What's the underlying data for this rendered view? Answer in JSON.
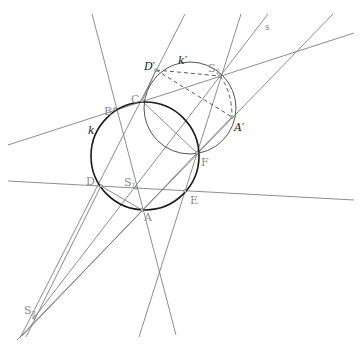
{
  "title_fragment": "",
  "colors": {
    "background": "#ffffff",
    "thin_line": "#707070",
    "circle_k": "#1a1a1a",
    "circle_k_prime": "#555555",
    "dashed": "#444444",
    "label_gray": "#8a8a8a",
    "label_dark": "#222222"
  },
  "labels": {
    "B": "B",
    "C": "C",
    "D": "D",
    "E": "E",
    "F": "F",
    "A": "A",
    "S1": "S",
    "S1_sub": "1",
    "S2": "S",
    "S2_sub": "2",
    "S3": "S",
    "S3_sub": "3",
    "D_prime": "D′",
    "A_prime": "A′",
    "k": "k",
    "k_prime": "k′",
    "s": "s"
  },
  "points": {
    "A": [
      142,
      210
    ],
    "B": [
      115,
      109
    ],
    "C": [
      142,
      101
    ],
    "D": [
      101,
      186
    ],
    "E": [
      185,
      191
    ],
    "F": [
      197,
      153
    ],
    "S1": [
      136,
      188
    ],
    "S2": [
      220,
      76
    ],
    "S3": [
      34,
      318
    ],
    "D_prime": [
      156,
      70
    ],
    "A_prime": [
      232,
      117
    ]
  },
  "circles": {
    "k": {
      "cx": 145,
      "cy": 156,
      "r": 54
    },
    "k_prime": {
      "cx": 190,
      "cy": 108,
      "r": 46
    }
  }
}
